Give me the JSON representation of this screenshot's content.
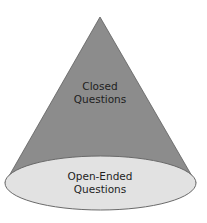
{
  "diagram": {
    "type": "cone",
    "colors": {
      "cone_body": "#8c8c8c",
      "cone_outline": "#5e5e5e",
      "base_fill": "#e2e2e2",
      "base_outline": "#6a6a6a",
      "text": "#1e1e1e"
    },
    "apex_label": {
      "line1": "Closed",
      "line2": "Questions"
    },
    "base_label": {
      "line1": "Open-Ended",
      "line2": "Questions"
    }
  }
}
